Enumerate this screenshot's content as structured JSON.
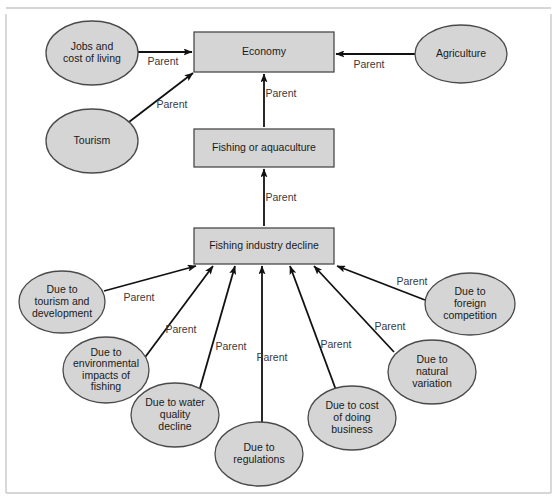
{
  "figure": {
    "frame_color": "#c9c9c9",
    "shape_fill": "#d5d5d5",
    "shape_stroke": "#4a4a4a",
    "edge_color": "#111111",
    "label_color": "#1a1a1a",
    "edge_label_color": "#3a3a3a"
  },
  "nodes": [
    {
      "id": "economy",
      "shape": "rect",
      "lines": [
        "Economy"
      ],
      "x": 194,
      "y": 32,
      "w": 140,
      "h": 40,
      "cx": 264,
      "cy": 52
    },
    {
      "id": "fishing-or-aquaculture",
      "shape": "rect",
      "lines": [
        "Fishing or aquaculture"
      ],
      "x": 194,
      "y": 129,
      "w": 140,
      "h": 38,
      "cx": 264,
      "cy": 148
    },
    {
      "id": "fishing-industry-decline",
      "shape": "rect",
      "lines": [
        "Fishing industry decline"
      ],
      "x": 194,
      "y": 228,
      "w": 140,
      "h": 36,
      "cx": 264,
      "cy": 246
    },
    {
      "id": "jobs-and-cost-of-living",
      "shape": "ellipse",
      "lines": [
        "Jobs and",
        "cost of living"
      ],
      "cx": 92,
      "cy": 53,
      "rx": 46,
      "ry": 32
    },
    {
      "id": "tourism",
      "shape": "ellipse",
      "lines": [
        "Tourism"
      ],
      "cx": 92,
      "cy": 141,
      "rx": 46,
      "ry": 32
    },
    {
      "id": "agriculture",
      "shape": "ellipse",
      "lines": [
        "Agriculture"
      ],
      "cx": 461,
      "cy": 54,
      "rx": 46,
      "ry": 29
    },
    {
      "id": "due-to-tourism-and-development",
      "shape": "ellipse",
      "lines": [
        "Due to",
        "tourism and",
        "development"
      ],
      "cx": 62,
      "cy": 302,
      "rx": 43,
      "ry": 31
    },
    {
      "id": "due-to-environmental-impacts-of-fishing",
      "shape": "ellipse",
      "lines": [
        "Due to",
        "environmental",
        "impacts of",
        "fishing"
      ],
      "cx": 106,
      "cy": 370,
      "rx": 43,
      "ry": 33
    },
    {
      "id": "due-to-water-quality-decline",
      "shape": "ellipse",
      "lines": [
        "Due to water",
        "quality",
        "decline"
      ],
      "cx": 175,
      "cy": 415,
      "rx": 44,
      "ry": 32
    },
    {
      "id": "due-to-regulations",
      "shape": "ellipse",
      "lines": [
        "Due to",
        "regulations"
      ],
      "cx": 259,
      "cy": 454,
      "rx": 44,
      "ry": 32
    },
    {
      "id": "due-to-cost-of-doing-business",
      "shape": "ellipse",
      "lines": [
        "Due to cost",
        "of doing",
        "business"
      ],
      "cx": 352,
      "cy": 418,
      "rx": 44,
      "ry": 32
    },
    {
      "id": "due-to-natural-variation",
      "shape": "ellipse",
      "lines": [
        "Due to",
        "natural",
        "variation"
      ],
      "cx": 432,
      "cy": 372,
      "rx": 44,
      "ry": 32
    },
    {
      "id": "due-to-foreign-competition",
      "shape": "ellipse",
      "lines": [
        "Due to",
        "foreign",
        "competition"
      ],
      "cx": 470,
      "cy": 304,
      "rx": 45,
      "ry": 31
    }
  ],
  "edges": [
    {
      "id": "jobs-to-economy",
      "from": "jobs-and-cost-of-living",
      "to": "economy",
      "x1": 138,
      "y1": 52,
      "x2": 192,
      "y2": 52,
      "label": "Parent",
      "lx": 163,
      "ly": 62
    },
    {
      "id": "tourism-to-economy",
      "from": "tourism",
      "to": "economy",
      "x1": 129,
      "y1": 122,
      "x2": 193,
      "y2": 73,
      "label": "Parent",
      "lx": 172,
      "ly": 105
    },
    {
      "id": "agriculture-to-economy",
      "from": "agriculture",
      "to": "economy",
      "x1": 415,
      "y1": 54,
      "x2": 336,
      "y2": 54,
      "label": "Parent",
      "lx": 369,
      "ly": 65
    },
    {
      "id": "fishing-to-economy",
      "from": "fishing-or-aquaculture",
      "to": "economy",
      "x1": 264,
      "y1": 127,
      "x2": 264,
      "y2": 74,
      "label": "Parent",
      "lx": 281,
      "ly": 94
    },
    {
      "id": "decline-to-fishing",
      "from": "fishing-industry-decline",
      "to": "fishing-or-aquaculture",
      "x1": 264,
      "y1": 226,
      "x2": 264,
      "y2": 169,
      "label": "Parent",
      "lx": 281,
      "ly": 198
    },
    {
      "id": "tourism-dev-to-decline",
      "from": "due-to-tourism-and-development",
      "to": "fishing-industry-decline",
      "x1": 104,
      "y1": 291,
      "x2": 196,
      "y2": 266,
      "label": "Parent",
      "lx": 139,
      "ly": 298
    },
    {
      "id": "environmental-to-decline",
      "from": "due-to-environmental-impacts-of-fishing",
      "to": "fishing-industry-decline",
      "x1": 143,
      "y1": 360,
      "x2": 213,
      "y2": 266,
      "label": "Parent",
      "lx": 181,
      "ly": 330
    },
    {
      "id": "water-quality-to-decline",
      "from": "due-to-water-quality-decline",
      "to": "fishing-industry-decline",
      "x1": 200,
      "y1": 388,
      "x2": 235,
      "y2": 266,
      "label": "Parent",
      "lx": 231,
      "ly": 347
    },
    {
      "id": "regulations-to-decline",
      "from": "due-to-regulations",
      "to": "fishing-industry-decline",
      "x1": 262,
      "y1": 422,
      "x2": 262,
      "y2": 266,
      "label": "Parent",
      "lx": 272,
      "ly": 358
    },
    {
      "id": "cost-of-business-to-decline",
      "from": "due-to-cost-of-doing-business",
      "to": "fishing-industry-decline",
      "x1": 336,
      "y1": 390,
      "x2": 290,
      "y2": 266,
      "label": "Parent",
      "lx": 336,
      "ly": 345
    },
    {
      "id": "natural-variation-to-decline",
      "from": "due-to-natural-variation",
      "to": "fishing-industry-decline",
      "x1": 394,
      "y1": 352,
      "x2": 314,
      "y2": 266,
      "label": "Parent",
      "lx": 390,
      "ly": 327
    },
    {
      "id": "foreign-competition-to-decline",
      "from": "due-to-foreign-competition",
      "to": "fishing-industry-decline",
      "x1": 425,
      "y1": 300,
      "x2": 337,
      "y2": 266,
      "label": "Parent",
      "lx": 412,
      "ly": 282
    }
  ],
  "frame": {
    "top_rule_y": 8,
    "left_x": 6,
    "right_x": 551,
    "bottom_y": 493
  }
}
